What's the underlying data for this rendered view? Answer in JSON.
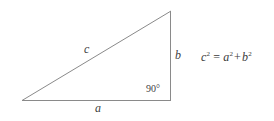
{
  "figure": {
    "type": "right-triangle-diagram",
    "background_color": "#ffffff",
    "stroke_color": "#8a8a8a",
    "text_color": "#3a3a3a"
  },
  "triangle": {
    "vertices": {
      "bottom_left": [
        22,
        100
      ],
      "bottom_right": [
        171,
        100
      ],
      "top_right": [
        171,
        11
      ]
    },
    "sides": {
      "hypotenuse_label": "c",
      "vertical_label": "b",
      "base_label": "a"
    },
    "right_angle_label": "90°"
  },
  "equation": {
    "lhs_base": "c",
    "lhs_exp": "2",
    "operator": "=",
    "term1_base": "a",
    "term1_exp": "2",
    "plus": "+",
    "term2_base": "b",
    "term2_exp": "2",
    "full_text": "c² = a² + b²"
  }
}
